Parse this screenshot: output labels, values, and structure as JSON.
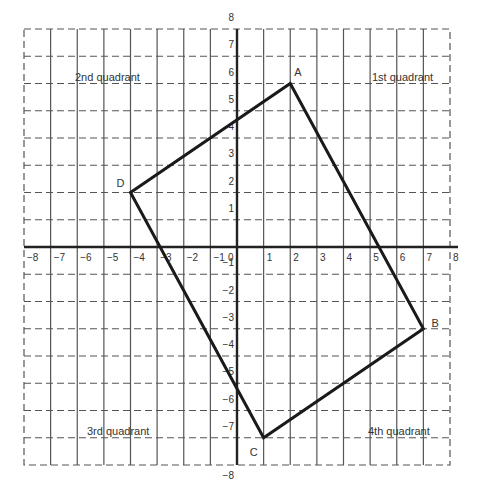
{
  "diagram": {
    "type": "coordinate-plane",
    "x_range": [
      -8,
      8
    ],
    "y_range": [
      -8,
      8
    ],
    "x_ticks": [
      "-8",
      "-7",
      "-6",
      "-5",
      "-4",
      "-3",
      "-2",
      "-1",
      "0",
      "1",
      "2",
      "3",
      "4",
      "5",
      "6",
      "7",
      "8"
    ],
    "y_ticks": [
      "8",
      "7",
      "6",
      "5",
      "4",
      "3",
      "2",
      "1",
      "-1",
      "-2",
      "-3",
      "-4",
      "-5",
      "-6",
      "-7",
      "-8"
    ],
    "quadrants": {
      "q1": "1st quadrant",
      "q2": "2nd quadrant",
      "q3": "3rd quadrant",
      "q4": "4th quadrant"
    },
    "points": [
      {
        "label": "A",
        "x": 2,
        "y": 6
      },
      {
        "label": "B",
        "x": 7,
        "y": -3
      },
      {
        "label": "C",
        "x": 1,
        "y": -7
      },
      {
        "label": "D",
        "x": -4,
        "y": 2
      }
    ],
    "polygon_order": [
      "A",
      "B",
      "C",
      "D"
    ],
    "colors": {
      "grid": "#555555",
      "axis": "#222222",
      "shape": "#1a1a1a",
      "text": "#333333"
    }
  }
}
